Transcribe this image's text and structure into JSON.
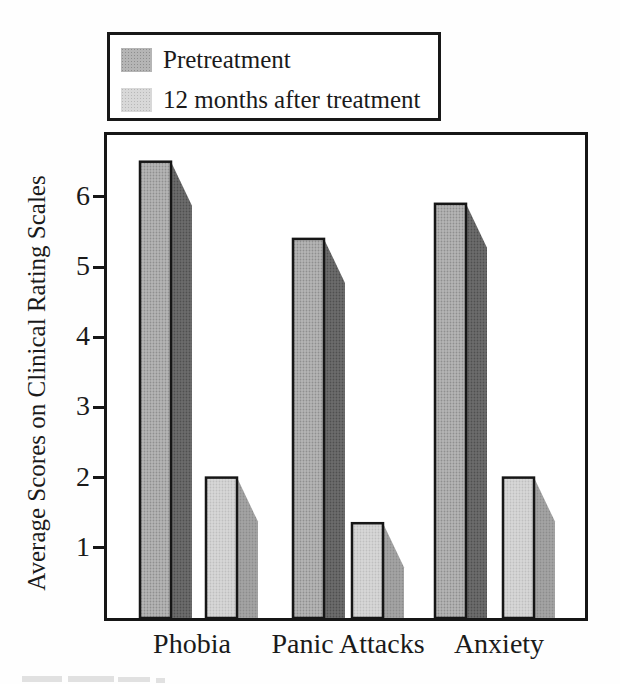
{
  "chart_data": {
    "type": "bar",
    "title": "",
    "categories": [
      "Phobia",
      "Panic Attacks",
      "Anxiety"
    ],
    "series": [
      {
        "name": "Pretreatment",
        "values": [
          6.5,
          5.4,
          5.9
        ]
      },
      {
        "name": "12 months after treatment",
        "values": [
          2.0,
          1.35,
          2.0
        ]
      }
    ],
    "ylabel": "Average Scores on Clinical Rating Scales",
    "xlabel": "",
    "ylim": [
      0,
      6.9
    ],
    "yticks": [
      1,
      2,
      3,
      4,
      5,
      6
    ],
    "grid": false,
    "legend_position": "top-left outside plot",
    "bar_style": "3d drop shadow, halftone gray fill, black outline",
    "colors": {
      "pre_front": "#b5b5b5",
      "pre_front_dot": "#8f8f8f",
      "pre_shadow": "#6d6d6d",
      "pre_shadow_dot": "#4f4f4f",
      "post_front": "#d8d8d8",
      "post_front_dot": "#bfbfbf",
      "post_shadow": "#a5a5a5",
      "post_shadow_dot": "#8c8c8c",
      "outline": "#161616",
      "text": "#1a1a1a"
    },
    "layout": {
      "plot": {
        "left": 104,
        "top": 132,
        "width": 478,
        "height": 483
      },
      "inner_origin": {
        "x": 107,
        "y": 135
      },
      "baseline_px": 483,
      "px_per_unit": 70.2,
      "bar_width": 31,
      "shadow_depth": 21,
      "shadow_drop": 44,
      "bar_x": [
        [
          33,
          186,
          328
        ],
        [
          99,
          245,
          396
        ]
      ],
      "label_centers": [
        85,
        241,
        392
      ]
    }
  }
}
